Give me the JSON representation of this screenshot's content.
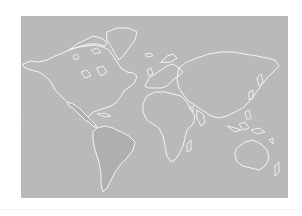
{
  "map": {
    "type": "world-map",
    "projection": "miller",
    "colors": {
      "ocean": "#b9b9b9",
      "coastline": "#f4f4f4",
      "highlighted_land": "#afafaf",
      "page_background": "#ffffff"
    },
    "highlighted_regions": [
      "South America",
      "Mexico and Central America"
    ]
  }
}
